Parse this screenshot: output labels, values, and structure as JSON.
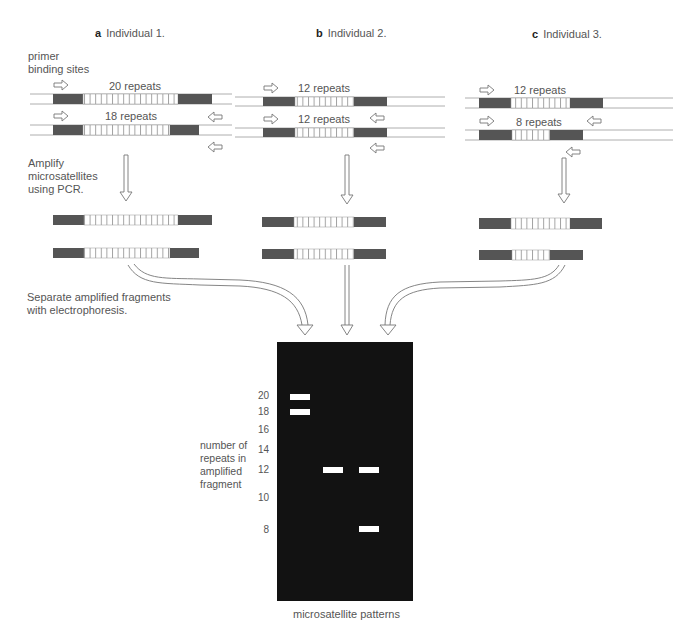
{
  "panels": [
    {
      "letter": "a",
      "title": "Individual 1.",
      "alleles": [
        {
          "label": "20 repeats",
          "repeats": 20
        },
        {
          "label": "18 repeats",
          "repeats": 18
        }
      ]
    },
    {
      "letter": "b",
      "title": "Individual 2.",
      "alleles": [
        {
          "label": "12 repeats",
          "repeats": 12
        },
        {
          "label": "12 repeats",
          "repeats": 12
        }
      ]
    },
    {
      "letter": "c",
      "title": "Individual 3.",
      "alleles": [
        {
          "label": "12 repeats",
          "repeats": 12
        },
        {
          "label": "8 repeats",
          "repeats": 8
        }
      ]
    }
  ],
  "labels": {
    "primer": "primer\nbinding sites",
    "amplify": "Amplify\nmicrosatellites\nusing PCR.",
    "separate": "Separate amplified fragments\nwith electrophoresis.",
    "yaxis": "number of\nrepeats in\namplified\nfragment",
    "gel_caption": "microsatellite patterns"
  },
  "gel": {
    "ticks": [
      "20",
      "18",
      "16",
      "14",
      "12",
      "10",
      "8"
    ],
    "lanes": [
      {
        "individual": "Individual 1.",
        "bands": [
          20,
          18
        ]
      },
      {
        "individual": "Individual 2.",
        "bands": [
          12
        ]
      },
      {
        "individual": "Individual 3.",
        "bands": [
          12,
          8
        ]
      }
    ]
  },
  "colors": {
    "flank": "#555555",
    "repeat_stroke": "#888888",
    "gel_bg": "#121212",
    "band": "#ffffff",
    "strand_line": "#9a9a9a"
  }
}
